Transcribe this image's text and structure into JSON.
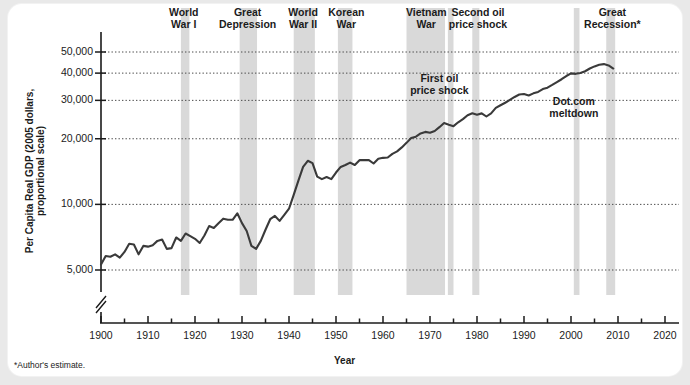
{
  "figure": {
    "ylabel": "Per Capita Real GDP (2005 dollars, proportional scale)",
    "xlabel": "Year",
    "footnote": "*Author's estimate.",
    "line_color": "#3a3a3a",
    "band_color": "#d9d9d9",
    "grid_color": "#4a4a4a",
    "axis_color": "#1b1b1b"
  },
  "chart_data": {
    "type": "line",
    "title": "",
    "xlabel": "Year",
    "ylabel": "Per Capita Real GDP (2005 dollars, proportional scale)",
    "yscale": "log",
    "xlim": [
      1900,
      2020
    ],
    "ylim": [
      4200,
      60000
    ],
    "grid": true,
    "legend": "none",
    "ytick_values": [
      5000,
      10000,
      20000,
      30000,
      40000,
      50000
    ],
    "ytick_labels": [
      "5,000",
      "10,000",
      "20,000",
      "30,000",
      "40,000",
      "50,000"
    ],
    "xtick_values": [
      1900,
      1910,
      1920,
      1930,
      1940,
      1950,
      1960,
      1970,
      1980,
      1990,
      2000,
      2010,
      2020
    ],
    "xtick_labels": [
      "1900",
      "1910",
      "1920",
      "1930",
      "1940",
      "1950",
      "1960",
      "1970",
      "1980",
      "1990",
      "2000",
      "2010",
      "2020"
    ],
    "xminor_step": 5,
    "axis_break": true,
    "series": [
      {
        "name": "Per Capita Real GDP",
        "x": [
          1900,
          1901,
          1902,
          1903,
          1904,
          1905,
          1906,
          1907,
          1908,
          1909,
          1910,
          1911,
          1912,
          1913,
          1914,
          1915,
          1916,
          1917,
          1918,
          1919,
          1920,
          1921,
          1922,
          1923,
          1924,
          1925,
          1926,
          1927,
          1928,
          1929,
          1930,
          1931,
          1932,
          1933,
          1934,
          1935,
          1936,
          1937,
          1938,
          1939,
          1940,
          1941,
          1942,
          1943,
          1944,
          1945,
          1946,
          1947,
          1948,
          1949,
          1950,
          1951,
          1952,
          1953,
          1954,
          1955,
          1956,
          1957,
          1958,
          1959,
          1960,
          1961,
          1962,
          1963,
          1964,
          1965,
          1966,
          1967,
          1968,
          1969,
          1970,
          1971,
          1972,
          1973,
          1974,
          1975,
          1976,
          1977,
          1978,
          1979,
          1980,
          1981,
          1982,
          1983,
          1984,
          1985,
          1986,
          1987,
          1988,
          1989,
          1990,
          1991,
          1992,
          1993,
          1994,
          1995,
          1996,
          1997,
          1998,
          1999,
          2000,
          2001,
          2002,
          2003,
          2004,
          2005,
          2006,
          2007,
          2008,
          2009
        ],
        "y": [
          5300,
          5800,
          5750,
          5900,
          5700,
          6050,
          6600,
          6550,
          5900,
          6450,
          6400,
          6500,
          6800,
          6900,
          6250,
          6300,
          7050,
          6800,
          7350,
          7150,
          6950,
          6650,
          7200,
          7950,
          7800,
          8200,
          8600,
          8500,
          8500,
          9100,
          8200,
          7550,
          6450,
          6250,
          6800,
          7650,
          8550,
          8850,
          8400,
          8950,
          9550,
          11050,
          12850,
          14850,
          15850,
          15450,
          13400,
          13050,
          13350,
          13050,
          14000,
          14850,
          15150,
          15550,
          15150,
          15950,
          15950,
          15950,
          15400,
          16200,
          16350,
          16400,
          17050,
          17500,
          18250,
          19150,
          20150,
          20450,
          21150,
          21500,
          21300,
          21700,
          22600,
          23600,
          23200,
          22850,
          23800,
          24600,
          25650,
          26200,
          25800,
          26150,
          25300,
          26150,
          27700,
          28500,
          29250,
          30150,
          31100,
          31900,
          32100,
          31600,
          32300,
          32800,
          33800,
          34300,
          35300,
          36400,
          37500,
          38800,
          39900,
          39700,
          40050,
          40800,
          42000,
          42950,
          43700,
          44000,
          43400,
          42000
        ]
      }
    ],
    "shaded_bands": [
      {
        "label": "World War I",
        "start": 1917,
        "end": 1918.8
      },
      {
        "label": "Great Depression",
        "start": 1929.5,
        "end": 1933.2
      },
      {
        "label": "World War II",
        "start": 1941,
        "end": 1945.5
      },
      {
        "label": "Korean War",
        "start": 1950.4,
        "end": 1953.5
      },
      {
        "label": "Vietnam War",
        "start": 1965,
        "end": 1973.2
      },
      {
        "label": "First oil price shock",
        "start": 1973.8,
        "end": 1975
      },
      {
        "label": "Second oil price shock",
        "start": 1979,
        "end": 1980.5
      },
      {
        "label": "Dot.com meltdown",
        "start": 2000.6,
        "end": 2001.8
      },
      {
        "label": "Great Recession",
        "start": 2007.5,
        "end": 2009.4
      }
    ],
    "annotations": [
      {
        "text": "World\nWar I",
        "position": "top",
        "x": 1917.8
      },
      {
        "text": "Great\nDepression",
        "position": "top",
        "x": 1931.2
      },
      {
        "text": "World\nWar II",
        "position": "top",
        "x": 1943.2
      },
      {
        "text": "Korean\nWar",
        "position": "top",
        "x": 1952.0
      },
      {
        "text": "Vietnam\nWar",
        "position": "top",
        "x": 1969.0
      },
      {
        "text": "Second oil\nprice shock",
        "position": "top",
        "x": 1979.8
      },
      {
        "text": "Great\nRecession*",
        "position": "top",
        "x": 2008.5
      },
      {
        "text": "First oil\nprice shock",
        "position": "inside",
        "x": 1974.0
      },
      {
        "text": "Dot.com\nmeltdown",
        "position": "inside",
        "x": 2001.2
      }
    ]
  },
  "annotations_top": [
    {
      "line1": "World",
      "line2": "War I"
    },
    {
      "line1": "Great",
      "line2": "Depression"
    },
    {
      "line1": "World",
      "line2": "War II"
    },
    {
      "line1": "Korean",
      "line2": "War"
    },
    {
      "line1": "Vietnam",
      "line2": "War"
    },
    {
      "line1": "Second oil",
      "line2": "price shock"
    },
    {
      "line1": "Great",
      "line2": "Recession*"
    }
  ],
  "annotations_inside": [
    {
      "line1": "First oil",
      "line2": "price shock"
    },
    {
      "line1": "Dot.com",
      "line2": "meltdown"
    }
  ]
}
